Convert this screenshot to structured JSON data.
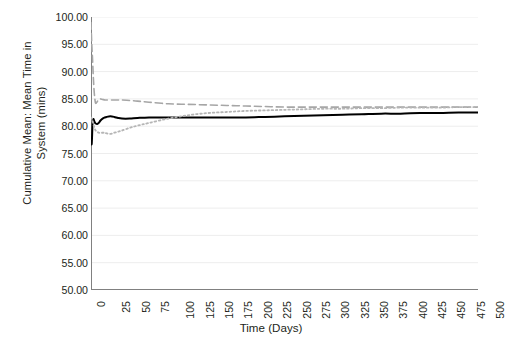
{
  "chart_data": {
    "type": "line",
    "title": "",
    "xlabel": "Time (Days)",
    "ylabel": "Cumulative Mean: Mean Time in System (mins)",
    "ylabel_lines": [
      "Cumulative Mean: Mean Time in",
      "System (mins)"
    ],
    "xlim": [
      0,
      500
    ],
    "ylim": [
      50,
      100
    ],
    "xticks": [
      0,
      25,
      50,
      75,
      100,
      125,
      150,
      175,
      200,
      225,
      250,
      275,
      300,
      325,
      350,
      375,
      400,
      425,
      450,
      475,
      500
    ],
    "xtick_labels": [
      "0",
      "25",
      "50",
      "75",
      "100",
      "125",
      "150",
      "175",
      "200",
      "225",
      "250",
      "275",
      "300",
      "325",
      "350",
      "375",
      "400",
      "425",
      "450",
      "475",
      "500"
    ],
    "yticks": [
      50,
      55,
      60,
      65,
      70,
      75,
      80,
      85,
      90,
      95,
      100
    ],
    "ytick_labels": [
      "50.00",
      "55.00",
      "60.00",
      "65.00",
      "70.00",
      "75.00",
      "80.00",
      "85.00",
      "90.00",
      "95.00",
      "100.00"
    ],
    "grid": "horizontal",
    "grid_color": "#ededed",
    "axis_color": "#808080",
    "background": "#ffffff",
    "legend": "none",
    "series": [
      {
        "name": "Replication 1",
        "style": "solid",
        "color": "#000000",
        "width": 2.0,
        "x": [
          0,
          1,
          2,
          3,
          4,
          5,
          6,
          8,
          10,
          12,
          15,
          18,
          20,
          25,
          30,
          35,
          40,
          50,
          60,
          75,
          100,
          125,
          150,
          175,
          200,
          225,
          250,
          275,
          300,
          325,
          350,
          375,
          400,
          425,
          450,
          475,
          500
        ],
        "values": [
          77.0,
          76.9,
          80.4,
          81.3,
          81.0,
          80.7,
          80.5,
          80.4,
          80.6,
          81.0,
          81.4,
          81.6,
          81.7,
          81.8,
          81.7,
          81.5,
          81.4,
          81.4,
          81.5,
          81.6,
          81.6,
          81.6,
          81.6,
          81.6,
          81.6,
          81.7,
          81.8,
          81.9,
          82.0,
          82.1,
          82.2,
          82.3,
          82.3,
          82.4,
          82.4,
          82.5,
          82.5
        ]
      },
      {
        "name": "Replication 2",
        "style": "dashed",
        "color": "#a6a6a6",
        "width": 1.6,
        "x": [
          0,
          1,
          2,
          3,
          4,
          5,
          6,
          8,
          10,
          12,
          15,
          18,
          20,
          25,
          30,
          35,
          40,
          50,
          60,
          75,
          100,
          125,
          150,
          175,
          200,
          225,
          250,
          275,
          300,
          325,
          350,
          375,
          400,
          425,
          450,
          475,
          500
        ],
        "values": [
          99.0,
          95.0,
          92.2,
          89.0,
          86.5,
          85.0,
          84.2,
          84.5,
          84.9,
          85.0,
          84.9,
          84.8,
          84.8,
          84.8,
          84.8,
          84.8,
          84.8,
          84.7,
          84.6,
          84.4,
          84.1,
          84.0,
          83.9,
          83.8,
          83.7,
          83.6,
          83.5,
          83.5,
          83.5,
          83.5,
          83.5,
          83.5,
          83.5,
          83.5,
          83.5,
          83.5,
          83.5
        ]
      },
      {
        "name": "Replication 3",
        "style": "dotted",
        "color": "#b5b5b5",
        "width": 1.8,
        "x": [
          0,
          1,
          2,
          3,
          4,
          5,
          6,
          8,
          10,
          12,
          15,
          18,
          20,
          25,
          30,
          35,
          40,
          50,
          60,
          75,
          100,
          125,
          150,
          175,
          200,
          225,
          250,
          275,
          300,
          325,
          350,
          375,
          400,
          425,
          450,
          475,
          500
        ],
        "values": [
          81.6,
          81.4,
          81.0,
          80.4,
          79.9,
          79.5,
          79.2,
          79.0,
          78.8,
          78.8,
          78.8,
          78.8,
          78.7,
          78.6,
          78.8,
          79.0,
          79.2,
          79.7,
          80.1,
          80.6,
          81.4,
          82.0,
          82.4,
          82.6,
          82.8,
          82.9,
          83.0,
          83.1,
          83.2,
          83.2,
          83.3,
          83.3,
          83.4,
          83.4,
          83.4,
          83.5,
          83.5
        ]
      }
    ]
  }
}
